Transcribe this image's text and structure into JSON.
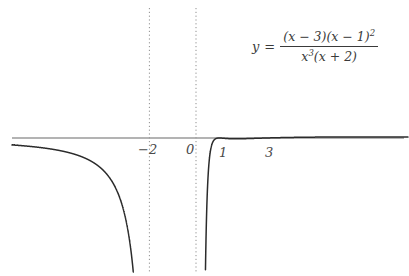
{
  "figure": {
    "width": 409,
    "height": 276,
    "background_color": "#ffffff"
  },
  "equation": {
    "lhs": "y",
    "equals": "=",
    "numerator_text": "(x − 3)(x − 1)²",
    "denominator_text": "x³(x + 2)",
    "numerator_parts": {
      "factor1": "(x − 3)(x − 1)",
      "exponent1": "2"
    },
    "denominator_parts": {
      "base": "x",
      "exponent": "3",
      "factor": "(x + 2)"
    }
  },
  "axes": {
    "x_axis_color": "#9a9a9a",
    "curve_color": "#2b2b2b",
    "asymptote_color": "#8f8f8f",
    "x_axis_pixel_y": 138,
    "origin_pixel_x": 196,
    "pixels_per_unit": 23.3,
    "x_axis_start_pixel": 12,
    "x_axis_end_pixel": 404,
    "tick_labels": [
      {
        "name": "neg-two",
        "text": "−2",
        "value": -2
      },
      {
        "name": "zero",
        "text": "0",
        "value": 0
      },
      {
        "name": "one",
        "text": "1",
        "value": 1
      },
      {
        "name": "three",
        "text": "3",
        "value": 3
      }
    ]
  },
  "chart_data": {
    "type": "line",
    "title": "",
    "xlabel": "",
    "ylabel": "",
    "function": "y = (x-3)(x-1)^2 / (x^3 (x+2))",
    "xlim": [
      -7.9,
      9.1
    ],
    "ylim": [
      -5.9,
      5.5
    ],
    "grid": false,
    "legend": null,
    "vertical_asymptotes": [
      -2,
      0
    ],
    "horizontal_asymptote": 0,
    "x_intercepts": [
      1,
      3
    ],
    "tangential_touch_points": [
      1
    ],
    "crossing_points": [
      3
    ],
    "zeros_multiplicity": {
      "1": 2,
      "3": 1
    },
    "local_extrema": [
      {
        "name": "branch-min-between-asymptotes",
        "x": -1.1,
        "y": 1.1,
        "kind": "minimum"
      },
      {
        "name": "touch-max-at-one",
        "x": 1.0,
        "y": 0.0,
        "kind": "maximum"
      },
      {
        "name": "local-min-right",
        "x": 1.9,
        "y": -1.0,
        "kind": "minimum"
      },
      {
        "name": "local-max-right",
        "x": 4.9,
        "y": 1.3,
        "kind": "maximum"
      }
    ],
    "branches": [
      {
        "name": "far-left",
        "domain": [
          -7.9,
          -2
        ],
        "approaches": "y=0 from below, -inf at x=-2"
      },
      {
        "name": "between-asymptotes",
        "domain": [
          -2,
          0
        ],
        "approaches": "+inf at both ends, U-shape"
      },
      {
        "name": "right",
        "domain": [
          0,
          9.1
        ],
        "approaches": "-inf at x=0, then y=0 from above"
      }
    ]
  }
}
